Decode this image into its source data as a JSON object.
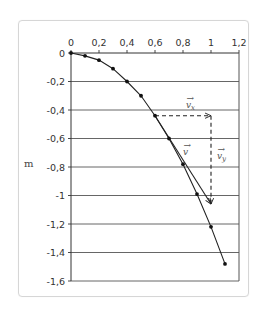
{
  "chart_data": {
    "type": "line",
    "title": "",
    "xlabel": "",
    "ylabel": "m",
    "xlim": [
      0,
      1.2
    ],
    "ylim": [
      -1.6,
      0
    ],
    "x_ticks": [
      "0",
      "0,2",
      "0,4",
      "0,6",
      "0,8",
      "1",
      "1,2"
    ],
    "y_ticks": [
      "0",
      "-0,2",
      "-0,4",
      "-0,6",
      "-0,8",
      "-1",
      "-1,2",
      "-1,4",
      "-1,6"
    ],
    "grid": {
      "horizontal": true,
      "vertical": false
    },
    "series": [
      {
        "name": "trajectory",
        "marker": "dot",
        "x": [
          0,
          0.1,
          0.2,
          0.3,
          0.4,
          0.5,
          0.6,
          0.7,
          0.8,
          0.9,
          1.0,
          1.1
        ],
        "y": [
          0,
          -0.02,
          -0.05,
          -0.11,
          -0.2,
          -0.3,
          -0.44,
          -0.6,
          -0.78,
          -0.99,
          -1.22,
          -1.48
        ]
      }
    ],
    "annotations": [
      {
        "label": "v_x",
        "type": "dashed-arrow",
        "from": [
          0.6,
          -0.44
        ],
        "to": [
          1.0,
          -0.44
        ]
      },
      {
        "label": "v_y",
        "type": "dashed-arrow",
        "from": [
          1.0,
          -0.44
        ],
        "to": [
          1.0,
          -1.06
        ]
      },
      {
        "label": "v",
        "type": "arrow",
        "from": [
          0.6,
          -0.44
        ],
        "to": [
          1.0,
          -1.06
        ]
      }
    ]
  },
  "labels": {
    "y_unit": "m",
    "vx": "v",
    "vx_sub": "x",
    "vy": "v",
    "vy_sub": "y",
    "v": "v"
  }
}
